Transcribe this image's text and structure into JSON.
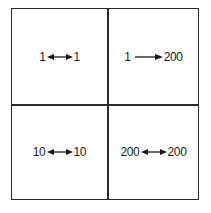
{
  "diagram": {
    "type": "2x2 grid",
    "cells": [
      {
        "position": "top-left",
        "left": "1",
        "right": "1",
        "arrow": "bidirectional",
        "arrow_glyph": "double-arrow-icon"
      },
      {
        "position": "top-right",
        "left": "1",
        "right": "200",
        "arrow": "right",
        "arrow_glyph": "right-arrow-icon"
      },
      {
        "position": "bottom-left",
        "left": "10",
        "right": "10",
        "arrow": "bidirectional",
        "arrow_glyph": "double-arrow-icon"
      },
      {
        "position": "bottom-right",
        "left": "200",
        "right": "200",
        "arrow": "bidirectional",
        "arrow_glyph": "double-arrow-icon"
      }
    ],
    "line_color": "#2a2a2a",
    "background": "#ffffff"
  }
}
